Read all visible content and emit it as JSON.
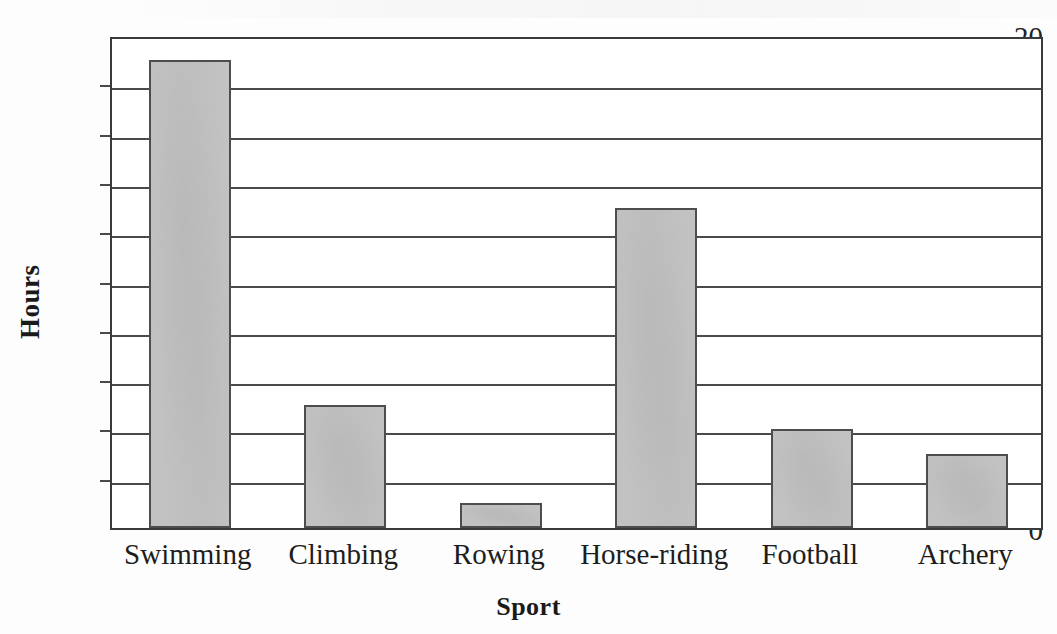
{
  "chart_data": {
    "type": "bar",
    "title": "",
    "subtitle": "",
    "xlabel": "Sport",
    "ylabel": "Hours",
    "categories": [
      "Swimming",
      "Climbing",
      "Rowing",
      "Horse-riding",
      "Football",
      "Archery"
    ],
    "values": [
      19,
      5,
      1,
      13,
      4,
      3
    ],
    "ylim": [
      0,
      20
    ],
    "ytick_step": 2,
    "ytick_labels": [
      "20",
      "18",
      "16",
      "14",
      "12",
      "10",
      "8",
      "6",
      "4",
      "2",
      "0"
    ],
    "ytick_values": [
      20,
      18,
      16,
      14,
      12,
      10,
      8,
      6,
      4,
      2,
      0
    ],
    "grid": true,
    "grid_axis": "y",
    "legend": false,
    "legend_position": "none",
    "bar_fill_color": "#c2c2c2",
    "bar_border_color": "#4d4d4d",
    "axis_color": "#3a3a3a",
    "grid_color": "#4a4a4a",
    "background_color": "#ffffff"
  },
  "axis": {
    "y_title": "Hours",
    "x_title": "Sport"
  }
}
